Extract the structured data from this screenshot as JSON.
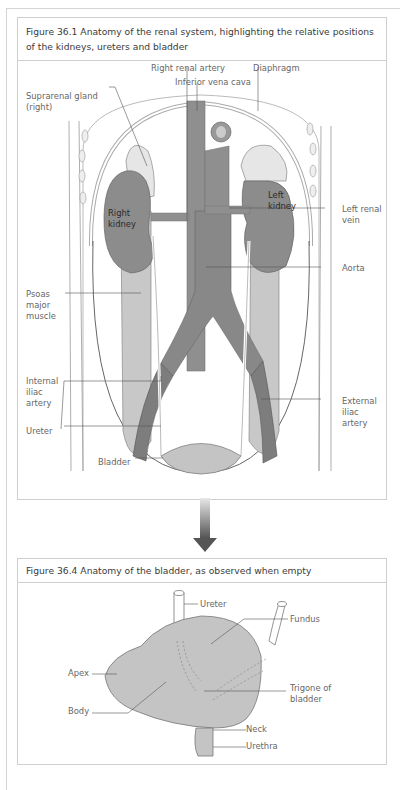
{
  "figure1": {
    "title": "Figure 36.1  Anatomy of the renal system, highlighting the relative positions of the kidneys, ureters and bladder",
    "labels": {
      "right_renal_artery": "Right renal artery",
      "inferior_vena_cava": "Inferior vena cava",
      "diaphragm": "Diaphragm",
      "suprarenal_gland": "Suprarenal gland\n(right)",
      "right_kidney": "Right\nkidney",
      "left_kidney": "Left\nkidney",
      "left_renal_vein": "Left renal\nvein",
      "aorta": "Aorta",
      "psoas": "Psoas\nmajor\nmuscle",
      "internal_iliac": "Internal\niliac\nartery",
      "external_iliac": "External\niliac\nartery",
      "ureter": "Ureter",
      "bladder": "Bladder"
    }
  },
  "arrow": {
    "icon": "down-arrow-icon"
  },
  "figure2": {
    "title": "Figure 36.4  Anatomy of the bladder, as observed when empty",
    "labels": {
      "ureter": "Ureter",
      "fundus": "Fundus",
      "apex": "Apex",
      "body": "Body",
      "trigone": "Trigone of\nbladder",
      "neck": "Neck",
      "urethra": "Urethra"
    }
  },
  "colors": {
    "kidney": "#8c8c8c",
    "vessel": "#8f8f8f",
    "muscle": "#c8c8c8",
    "gland": "#e6e6e6",
    "bladder": "#c4c4c4",
    "line": "#555555"
  }
}
